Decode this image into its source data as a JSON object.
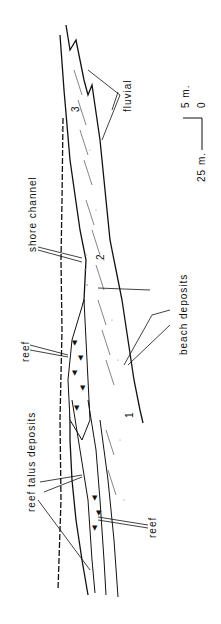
{
  "diagram": {
    "orientation": "rotated 90 degrees counter-clockwise",
    "labels": {
      "fluvial": "fluvial",
      "shore_channel": "shore channel",
      "beach_deposits": "beach deposits",
      "reef_top": "reef",
      "reef_talus": "reef talus deposits",
      "reef_bottom": "reef",
      "unit_1": "1",
      "unit_2": "2",
      "unit_3": "3"
    },
    "scale": {
      "vertical": "5 m.",
      "horizontal": "25 m.",
      "origin": "0"
    },
    "colors": {
      "ink": "#111111",
      "background": "#ffffff",
      "dots": "#888888"
    }
  }
}
